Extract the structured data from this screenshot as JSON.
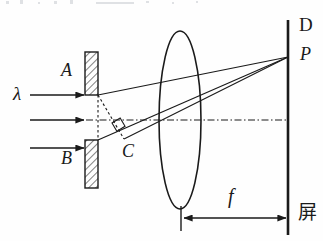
{
  "figure": {
    "background_color": "#fefefe",
    "ink_color": "#1a1a1a",
    "width": 323,
    "height": 241
  },
  "labels": {
    "wavelength": "λ",
    "slit_top": "A",
    "slit_bottom": "B",
    "foot_point": "C",
    "screen_letter": "D",
    "focus_point": "P",
    "focal_length": "f",
    "screen_cjk": "屏"
  },
  "elements": {
    "incoming_rays": {
      "name": "incident plane wave arrows",
      "count": 3,
      "y_positions": [
        95,
        120,
        148
      ],
      "x_start": 30,
      "x_end": 85,
      "arrowhead": "solid-triangle"
    },
    "barrier": {
      "name": "double-slit barrier",
      "hatched": true,
      "x": 85,
      "width": 13,
      "top_block": {
        "y": 52,
        "height": 43
      },
      "bottom_block": {
        "y": 140,
        "height": 48
      },
      "slit_top_y": 95,
      "slit_bottom_y": 140
    },
    "construction": {
      "name": "path-difference construction",
      "style": "dashed",
      "vertical_from": [
        98,
        95
      ],
      "vertical_to": [
        98,
        140
      ],
      "hypotenuse_from": [
        98,
        95
      ],
      "hypotenuse_to": [
        123,
        138
      ],
      "right_angle_marker": {
        "x": 112,
        "y": 123,
        "size": 9,
        "rotation": -31
      }
    },
    "optical_axis": {
      "name": "optical axis",
      "style": "dash-dot",
      "y": 120,
      "x_start": 86,
      "x_end": 288
    },
    "lens": {
      "name": "converging lens",
      "shape": "ellipse",
      "center_x": 180,
      "center_y": 120,
      "rx": 21,
      "ry": 89
    },
    "rays_to_focus": {
      "name": "diffracted rays converging at P",
      "count": 3,
      "origins": [
        [
          98,
          95
        ],
        [
          98,
          140
        ],
        [
          123,
          138
        ]
      ],
      "target": [
        288,
        57
      ]
    },
    "screen": {
      "name": "observation screen",
      "x": 288,
      "y_top": 20,
      "y_bottom": 235,
      "orientation": "vertical"
    },
    "focal_dimension": {
      "name": "focal length dimension arrow",
      "y": 218,
      "x_start": 181,
      "x_end": 289,
      "arrowheads": "both",
      "tick_lens_x": 181,
      "tick_lens_y_top": 208,
      "tick_screen_x": 289
    }
  },
  "label_positions": {
    "wavelength": {
      "x": 13,
      "y": 86
    },
    "slit_top": {
      "x": 61,
      "y": 62
    },
    "slit_bottom": {
      "x": 61,
      "y": 150
    },
    "foot_point": {
      "x": 122,
      "y": 143
    },
    "screen_letter": {
      "x": 299,
      "y": 18
    },
    "focus_point": {
      "x": 300,
      "y": 47
    },
    "focal_length": {
      "x": 228,
      "y": 189
    },
    "screen_cjk": {
      "x": 299,
      "y": 204
    }
  }
}
